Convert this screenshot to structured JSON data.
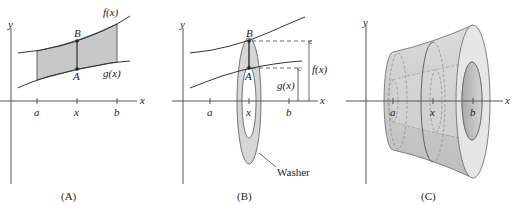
{
  "figure": {
    "panels": [
      {
        "id": "A",
        "caption": "(A)",
        "axis_labels": {
          "x": "x",
          "y": "y"
        },
        "ticks": [
          "a",
          "x",
          "b"
        ],
        "curves": [
          "f(x)",
          "g(x)"
        ],
        "points": [
          "B",
          "A"
        ],
        "description": "Shaded region between f(x) and g(x) from a to b with vertical segment AB at x"
      },
      {
        "id": "B",
        "caption": "(B)",
        "axis_labels": {
          "x": "x",
          "y": "y"
        },
        "ticks": [
          "a",
          "x",
          "b"
        ],
        "points": [
          "B",
          "A"
        ],
        "dimension_labels": [
          "f(x)",
          "g(x)"
        ],
        "callout": "Washer",
        "description": "Segment AB rotated about x-axis forms a washer with outer radius f(x) and inner radius g(x)"
      },
      {
        "id": "C",
        "caption": "(C)",
        "axis_labels": {
          "x": "x",
          "y": "y"
        },
        "ticks": [
          "a",
          "x",
          "b"
        ],
        "description": "Solid of revolution with a hollow core obtained by rotating the region about the x-axis"
      }
    ],
    "colors": {
      "line": "#333333",
      "fill": "#cfcfcf",
      "fill_light": "#e4e4e4",
      "fill_dark": "#b8b8b8",
      "background": "#ffffff"
    }
  }
}
